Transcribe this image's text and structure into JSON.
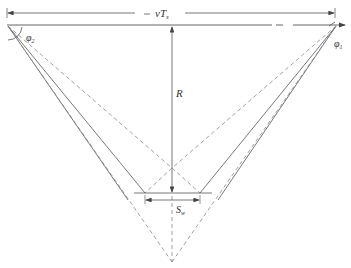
{
  "diagram": {
    "labels": {
      "top_dimension": "vT",
      "top_dimension_sub": "s",
      "range": "R",
      "angle_left": "φ",
      "angle_left_sub": "2",
      "angle_right": "φ",
      "angle_right_sub": "1",
      "swath": "S",
      "swath_sub": "w"
    },
    "colors": {
      "line": "#555555",
      "dashed": "#888888",
      "text": "#333333"
    }
  }
}
